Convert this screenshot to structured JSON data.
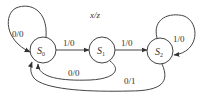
{
  "diagram": {
    "type": "finite-state-machine",
    "legend": "x/z",
    "states": [
      {
        "id": "S0",
        "label": "S",
        "sub": "0"
      },
      {
        "id": "S1",
        "label": "S",
        "sub": "1"
      },
      {
        "id": "S2",
        "label": "S",
        "sub": "2"
      }
    ],
    "transitions": [
      {
        "from": "S0",
        "to": "S0",
        "label": "0/0"
      },
      {
        "from": "S0",
        "to": "S1",
        "label": "1/0"
      },
      {
        "from": "S1",
        "to": "S2",
        "label": "1/0"
      },
      {
        "from": "S2",
        "to": "S2",
        "label": "1/0"
      },
      {
        "from": "S1",
        "to": "S0",
        "label": "0/0"
      },
      {
        "from": "S2",
        "to": "S0",
        "label": "0/1"
      }
    ],
    "colors": {
      "stroke": "#444444",
      "text": "#333333",
      "background": "#ffffff"
    }
  }
}
